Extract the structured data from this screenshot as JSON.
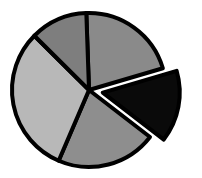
{
  "chart_data": {
    "type": "pie",
    "title": "",
    "legend": [],
    "exploded_index": 1,
    "start_angle_deg": -2,
    "direction": "clockwise",
    "center": [
      89,
      90
    ],
    "radius": 77,
    "explode_offset": 14,
    "slices": [
      {
        "label": "",
        "value": 21,
        "color": "#8a8a8a"
      },
      {
        "label": "",
        "value": 15,
        "color": "#0a0a0a"
      },
      {
        "label": "",
        "value": 21,
        "color": "#8e8e8e"
      },
      {
        "label": "",
        "value": 31,
        "color": "#b8b8b8"
      },
      {
        "label": "",
        "value": 12,
        "color": "#7e7e7e"
      }
    ]
  }
}
